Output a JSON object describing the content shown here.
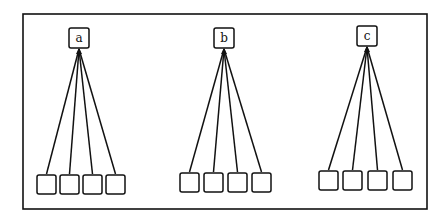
{
  "diagram": {
    "frame": {
      "x": 23,
      "y": 14,
      "w": 404,
      "h": 195
    },
    "stroke_color": "#111111",
    "groups": [
      {
        "label": "a",
        "root": {
          "x": 69,
          "y": 28,
          "w": 20,
          "h": 20
        },
        "children": [
          {
            "x": 37,
            "y": 175
          },
          {
            "x": 60,
            "y": 175
          },
          {
            "x": 83,
            "y": 175
          },
          {
            "x": 106,
            "y": 175
          }
        ],
        "child_size": 19
      },
      {
        "label": "b",
        "root": {
          "x": 214,
          "y": 28,
          "w": 20,
          "h": 20
        },
        "children": [
          {
            "x": 180,
            "y": 173
          },
          {
            "x": 204,
            "y": 173
          },
          {
            "x": 228,
            "y": 173
          },
          {
            "x": 252,
            "y": 173
          }
        ],
        "child_size": 19
      },
      {
        "label": "c",
        "root": {
          "x": 357,
          "y": 26,
          "w": 20,
          "h": 20
        },
        "children": [
          {
            "x": 319,
            "y": 171
          },
          {
            "x": 343,
            "y": 171
          },
          {
            "x": 368,
            "y": 171
          },
          {
            "x": 393,
            "y": 171
          }
        ],
        "child_size": 19
      }
    ]
  }
}
